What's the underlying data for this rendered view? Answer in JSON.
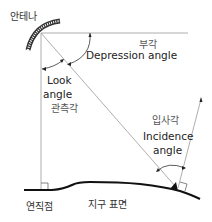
{
  "labels": {
    "antenna": "안테나",
    "depression_ko": "부각",
    "depression_en": "Depression angle",
    "look_en_1": "Look",
    "look_en_2": "angle",
    "look_ko": "관측각",
    "incidence_ko": "입사각",
    "incidence_en_1": "Incidence",
    "incidence_en_2": "angle",
    "nadir_ko": "연직점",
    "surface_ko": "지구 표면"
  },
  "colors": {
    "line": "#888888",
    "ground": "#111111",
    "antenna": "#333333",
    "text": "#333333"
  }
}
